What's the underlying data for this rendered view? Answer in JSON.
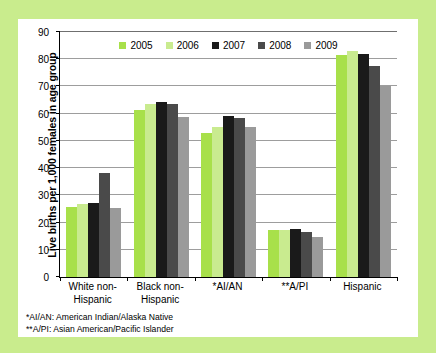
{
  "chart_data": {
    "type": "bar",
    "title": "",
    "xlabel": "",
    "ylabel": "Live births per 1,000 females in age group",
    "ylim": [
      0,
      90
    ],
    "ytick_step": 10,
    "yticks": [
      0,
      10,
      20,
      30,
      40,
      50,
      60,
      70,
      80,
      90
    ],
    "grid": true,
    "legend_position": "top-center",
    "categories": [
      "White non-Hispanic",
      "Black non-Hispanic",
      "*AI/AN",
      "**A/PI",
      "Hispanic"
    ],
    "series": [
      {
        "name": "2005",
        "color": "#a8e04a",
        "values": [
          25.8,
          61.2,
          52.9,
          17.2,
          81.7
        ]
      },
      {
        "name": "2006",
        "color": "#c9eb8f",
        "values": [
          26.7,
          63.7,
          55.0,
          17.1,
          83.0
        ]
      },
      {
        "name": "2007",
        "color": "#1a1a1a",
        "values": [
          27.2,
          64.3,
          59.0,
          17.6,
          81.8
        ]
      },
      {
        "name": "2008",
        "color": "#4a4a4a",
        "values": [
          38.2,
          63.4,
          58.5,
          16.5,
          77.5
        ]
      },
      {
        "name": "2009",
        "color": "#9a9a9a",
        "values": [
          25.4,
          58.9,
          55.1,
          14.8,
          70.1
        ]
      }
    ],
    "annotations": [
      "*AI/AN: American Indian/Alaska Native",
      "**A/PI: Asian American/Pacific Islander"
    ]
  },
  "figure": {
    "background_color": "#c9ec8d",
    "card_color": "#ffffff",
    "axis_color": "#000000",
    "gridline_color": "#9d9d9d"
  }
}
